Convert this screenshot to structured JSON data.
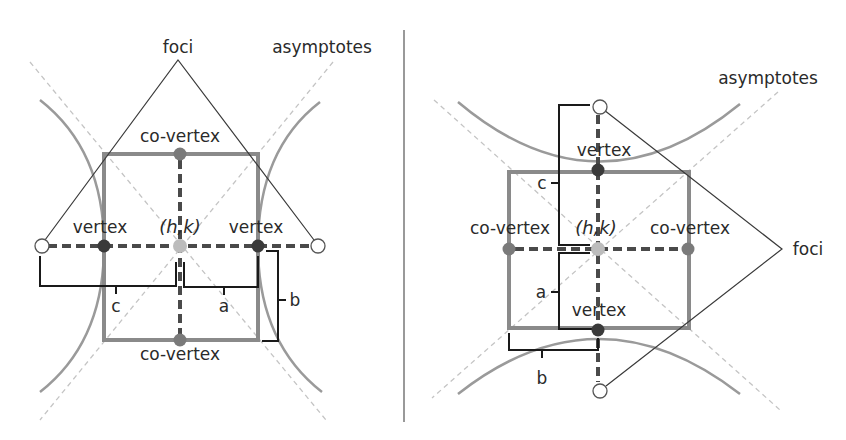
{
  "diagram": {
    "colors": {
      "curve": "#9a9a9a",
      "asymptote": "#c4c4c4",
      "rectangle": "#8a8a8a",
      "axis": "#4a4a4a",
      "vertex_point": "#3a3a3a",
      "covertex_point": "#7a7a7a",
      "center_point": "#bcbcbc",
      "focus_point": "#ffffff"
    },
    "left": {
      "orientation": "horizontal",
      "labels": {
        "foci": "foci",
        "asymptotes": "asymptotes",
        "covertex_top": "co-vertex",
        "covertex_bottom": "co-vertex",
        "vertex_left": "vertex",
        "vertex_right": "vertex",
        "center": "(h,k)",
        "c": "c",
        "a": "a",
        "b": "b"
      }
    },
    "right": {
      "orientation": "vertical",
      "labels": {
        "foci": "foci",
        "asymptotes": "asymptotes",
        "vertex_top": "vertex",
        "vertex_bottom": "vertex",
        "covertex_left": "co-vertex",
        "covertex_right": "co-vertex",
        "center": "(h,k)",
        "c": "c",
        "a": "a",
        "b": "b"
      }
    }
  }
}
